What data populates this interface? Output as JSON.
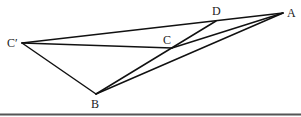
{
  "diagram": {
    "type": "geometry-figure",
    "points": {
      "A": {
        "label": "A",
        "x": 283,
        "y": 13,
        "lx": 287,
        "ly": 17
      },
      "D": {
        "label": "D",
        "x": 216,
        "y": 21,
        "lx": 213,
        "ly": 15
      },
      "C": {
        "label": "C",
        "x": 172,
        "y": 48,
        "lx": 163,
        "ly": 44
      },
      "Cp": {
        "label": "C′",
        "x": 22,
        "y": 43,
        "lx": 7,
        "ly": 47
      },
      "B": {
        "label": "B",
        "x": 96,
        "y": 94,
        "lx": 91,
        "ly": 108
      }
    },
    "segments": [
      {
        "from": "Cp",
        "to": "A"
      },
      {
        "from": "Cp",
        "to": "C"
      },
      {
        "from": "Cp",
        "to": "B"
      },
      {
        "from": "B",
        "to": "A"
      },
      {
        "from": "B",
        "to": "D"
      },
      {
        "from": "C",
        "to": "A"
      }
    ],
    "colors": {
      "line": "#111111",
      "rule": "#555555",
      "background": "#ffffff"
    }
  }
}
